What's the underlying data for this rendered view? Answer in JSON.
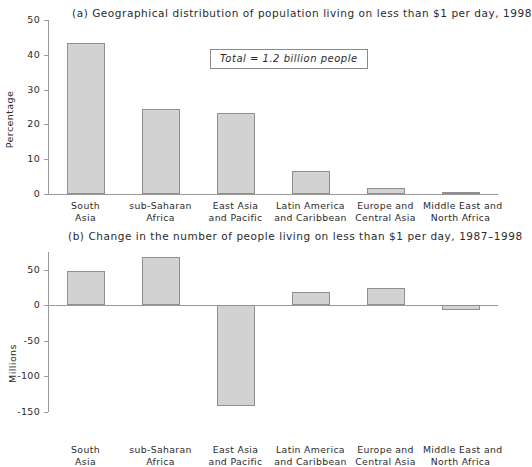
{
  "figure": {
    "panels": [
      {
        "key": "a",
        "title": "(a) Geographical distribution of population living on less than $1 per day, 1998",
        "ylabel": "Percentage",
        "annotation": "Total  =  1.2 billion people"
      },
      {
        "key": "b",
        "title": "(b) Change in the number of people living on less than $1 per day, 1987–1998",
        "ylabel": "Millions",
        "annotation": ""
      }
    ]
  },
  "chart_data": [
    {
      "type": "bar",
      "title": "(a) Geographical distribution of population living on less than $1 per day, 1998",
      "xlabel": "",
      "ylabel": "Percentage",
      "ylim": [
        0,
        50
      ],
      "yticks": [
        0,
        10,
        20,
        30,
        40,
        50
      ],
      "ytick_labels": [
        "0",
        "10",
        "20",
        "30",
        "40",
        "50"
      ],
      "grid": false,
      "legend": "none",
      "annotation": "Total  =  1.2 billion people",
      "categories": [
        "South Asia",
        "sub-Saharan Africa",
        "East Asia and Pacific",
        "Latin America and Caribbean",
        "Europe and Central Asia",
        "Middle East and North Africa"
      ],
      "category_lines": [
        [
          "South",
          "Asia"
        ],
        [
          "sub-Saharan",
          "Africa"
        ],
        [
          "East Asia",
          "and Pacific"
        ],
        [
          "Latin America",
          "and Caribbean"
        ],
        [
          "Europe and",
          "Central Asia"
        ],
        [
          "Middle East and",
          "North Africa"
        ]
      ],
      "values": [
        43.5,
        24.3,
        23.2,
        6.5,
        1.7,
        0.5
      ],
      "bar_color": "#d2d2d2",
      "bar_edge_color": "#8f8f8f"
    },
    {
      "type": "bar",
      "title": "(b) Change in the number of people living on less than $1 per day, 1987–1998",
      "xlabel": "",
      "ylabel": "Millions",
      "ylim": [
        -150,
        75
      ],
      "yticks": [
        50,
        0,
        -50,
        -100,
        -150
      ],
      "ytick_labels": [
        "50",
        "0",
        "-50",
        "-100",
        "-150"
      ],
      "grid": false,
      "legend": "none",
      "categories": [
        "South Asia",
        "sub-Saharan Africa",
        "East Asia and Pacific",
        "Latin America and Caribbean",
        "Europe and Central Asia",
        "Middle East and North Africa"
      ],
      "category_lines": [
        [
          "South",
          "Asia"
        ],
        [
          "sub-Saharan",
          "Africa"
        ],
        [
          "East Asia",
          "and Pacific"
        ],
        [
          "Latin America",
          "and Caribbean"
        ],
        [
          "Europe and",
          "Central Asia"
        ],
        [
          "Middle East and",
          "North Africa"
        ]
      ],
      "values": [
        48,
        68,
        -142,
        19,
        24,
        -7
      ],
      "bar_color": "#d2d2d2",
      "bar_edge_color": "#8f8f8f"
    }
  ]
}
